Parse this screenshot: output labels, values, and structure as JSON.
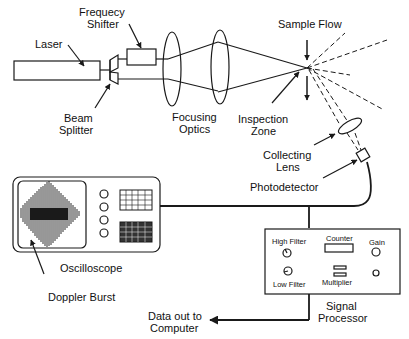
{
  "labels": {
    "laser": "Laser",
    "frequency_shifter_line1": "Frequecy",
    "frequency_shifter_line2": "Shifter",
    "beam_splitter_line1": "Beam",
    "beam_splitter_line2": "Splitter",
    "focusing_optics_line1": "Focusing",
    "focusing_optics_line2": "Optics",
    "inspection_zone_line1": "Inspection",
    "inspection_zone_line2": "Zone",
    "sample_flow": "Sample Flow",
    "collecting_lens_line1": "Collecting",
    "collecting_lens_line2": "Lens",
    "photodetector": "Photodetector",
    "oscilloscope": "Oscilloscope",
    "doppler_burst": "Doppler Burst",
    "data_out_line1": "Data out to",
    "data_out_line2": "Computer",
    "signal_processor_line1": "Signal",
    "signal_processor_line2": "Processor"
  },
  "signal_processor_panel": {
    "high_filter": "High Filter",
    "low_filter": "Low Filter",
    "counter": "Counter",
    "multiplier": "Multiplier",
    "gain": "Gain"
  },
  "colors": {
    "stroke": "#1a1a1a",
    "background": "#ffffff"
  }
}
